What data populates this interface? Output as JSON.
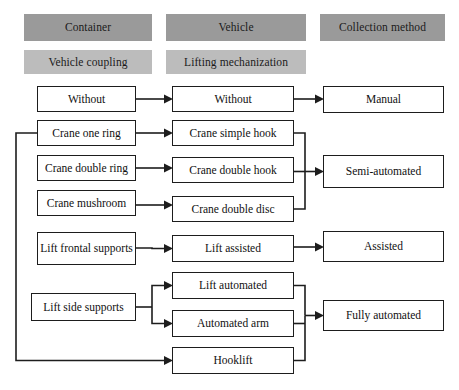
{
  "diagram": {
    "colors": {
      "header_dark": "#9a9a9a",
      "header_light": "#bcbcbc",
      "node_border": "#1d1d1d",
      "node_fill": "#ffffff",
      "connector": "#1d1d1d"
    },
    "headers": [
      {
        "label": "Container",
        "tone": "dark",
        "x": 24,
        "y": 14,
        "w": 128,
        "h": 27
      },
      {
        "label": "Vehicle",
        "tone": "dark",
        "x": 166,
        "y": 14,
        "w": 140,
        "h": 27
      },
      {
        "label": "Collection method",
        "tone": "dark",
        "x": 320,
        "y": 14,
        "w": 125,
        "h": 27
      },
      {
        "label": "Vehicle coupling",
        "tone": "light",
        "x": 24,
        "y": 50,
        "w": 128,
        "h": 24
      },
      {
        "label": "Lifting mechanization",
        "tone": "light",
        "x": 166,
        "y": 50,
        "w": 140,
        "h": 24
      }
    ],
    "columns": {
      "container": {
        "header": "Container",
        "subheader": "Vehicle coupling",
        "nodes": [
          {
            "label": "Without",
            "x": 37,
            "y": 86,
            "w": 99,
            "h": 26
          },
          {
            "label": "Crane one ring",
            "x": 37,
            "y": 120,
            "w": 99,
            "h": 26
          },
          {
            "label": "Crane double ring",
            "x": 37,
            "y": 155,
            "w": 99,
            "h": 26
          },
          {
            "label": "Crane mushroom",
            "x": 37,
            "y": 190,
            "w": 99,
            "h": 26
          },
          {
            "label": "Lift frontal supports",
            "x": 37,
            "y": 232,
            "w": 99,
            "h": 33
          },
          {
            "label": "Lift side supports",
            "x": 31,
            "y": 293,
            "w": 105,
            "h": 28
          }
        ]
      },
      "vehicle": {
        "header": "Vehicle",
        "subheader": "Lifting mechanization",
        "nodes": [
          {
            "label": "Without",
            "x": 172,
            "y": 86,
            "w": 122,
            "h": 26
          },
          {
            "label": "Crane simple hook",
            "x": 172,
            "y": 120,
            "w": 122,
            "h": 26
          },
          {
            "label": "Crane double hook",
            "x": 172,
            "y": 157,
            "w": 122,
            "h": 26
          },
          {
            "label": "Crane double disc",
            "x": 172,
            "y": 196,
            "w": 122,
            "h": 26
          },
          {
            "label": "Lift assisted",
            "x": 172,
            "y": 235,
            "w": 122,
            "h": 27
          },
          {
            "label": "Lift automated",
            "x": 172,
            "y": 272,
            "w": 122,
            "h": 27
          },
          {
            "label": "Automated arm",
            "x": 172,
            "y": 310,
            "w": 122,
            "h": 27
          },
          {
            "label": "Hooklift",
            "x": 172,
            "y": 347,
            "w": 122,
            "h": 27
          }
        ]
      },
      "collection": {
        "header": "Collection method",
        "nodes": [
          {
            "label": "Manual",
            "x": 323,
            "y": 86,
            "w": 121,
            "h": 27
          },
          {
            "label": "Semi-automated",
            "x": 323,
            "y": 155,
            "w": 121,
            "h": 33
          },
          {
            "label": "Assisted",
            "x": 323,
            "y": 231,
            "w": 121,
            "h": 31
          },
          {
            "label": "Fully automated",
            "x": 323,
            "y": 300,
            "w": 121,
            "h": 31
          }
        ]
      }
    },
    "connections": [
      {
        "from": "Without (coupling)",
        "to": "Without (lifting)"
      },
      {
        "from": "Crane one ring",
        "to": "Crane simple hook"
      },
      {
        "from": "Crane double ring",
        "to": "Crane double hook"
      },
      {
        "from": "Crane mushroom",
        "to": "Crane double disc"
      },
      {
        "from": "Lift frontal supports",
        "to": "Lift assisted"
      },
      {
        "from": "Lift side supports",
        "to": "Lift automated"
      },
      {
        "from": "Lift side supports",
        "to": "Automated arm"
      },
      {
        "from": "Crane one ring (bus)",
        "to": "Hooklift"
      },
      {
        "from": "Without (lifting)",
        "to": "Manual"
      },
      {
        "from": "Crane simple hook",
        "to": "Semi-automated"
      },
      {
        "from": "Crane double hook",
        "to": "Semi-automated"
      },
      {
        "from": "Crane double disc",
        "to": "Semi-automated"
      },
      {
        "from": "Lift assisted",
        "to": "Assisted"
      },
      {
        "from": "Lift automated",
        "to": "Fully automated"
      },
      {
        "from": "Automated arm",
        "to": "Fully automated"
      },
      {
        "from": "Hooklift",
        "to": "Fully automated"
      }
    ]
  }
}
